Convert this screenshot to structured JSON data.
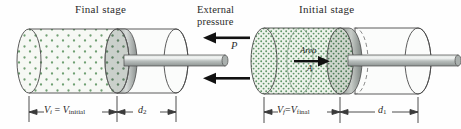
{
  "figure": {
    "title_left": "Final stage",
    "title_right": "Initial stage",
    "background_color": "#fefefe",
    "gas_color": "#7aa97e",
    "cylinder_fill": "#f4f6f3",
    "metal_color": "#b9bfbd",
    "outline_color": "#3a3a3a"
  },
  "pressure_label": {
    "line1": "External",
    "line2": "pressure",
    "symbol": "P",
    "arrow_direction": "left",
    "arrow_count": 2
  },
  "left_panel": {
    "name": "final-stage",
    "gas_density": "sparse",
    "dimension_1": {
      "text_v": "V",
      "text_v_sub": "i",
      "equals": "=",
      "text_v2": "V",
      "text_v2_sub": "initial"
    },
    "dimension_2": {
      "text": "d",
      "sub": "2"
    }
  },
  "right_panel": {
    "name": "initial-stage",
    "gas_density": "dense",
    "area_label": {
      "text": "Area",
      "symbol": "A",
      "arrow_direction": "right"
    },
    "dimension_1": {
      "text_v": "V",
      "text_v_sub": "f",
      "equals": "=",
      "text_v2": "V",
      "text_v2_sub": "final"
    },
    "dimension_2": {
      "text": "d",
      "sub": "1"
    }
  }
}
